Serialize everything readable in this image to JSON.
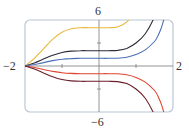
{
  "chart_data": {
    "type": "line",
    "title": "",
    "xlabel": "",
    "ylabel": "",
    "xlim": [
      -2,
      2
    ],
    "ylim": [
      -6,
      6
    ],
    "grid": false,
    "legend": null,
    "tick_labels": {
      "x_min": "−2",
      "x_max": "2",
      "y_max": "6",
      "y_min": "−6"
    },
    "x_ticks": [
      -1,
      0,
      1
    ],
    "y_ticks": [
      -3,
      0,
      3
    ],
    "x": [
      -2,
      -1.75,
      -1.5,
      -1.25,
      -1,
      -0.75,
      -0.5,
      -0.25,
      0,
      0.25,
      0.5,
      0.75,
      1,
      1.25,
      1.5,
      1.6,
      1.7,
      1.8,
      1.9,
      2
    ],
    "series": [
      {
        "name": "C=5",
        "color": "#e8b83a",
        "plateau": 5
      },
      {
        "name": "C=2",
        "color": "#2b2b3a",
        "plateau": 2
      },
      {
        "name": "C=1",
        "color": "#4a6fb5",
        "plateau": 1
      },
      {
        "name": "C=-1",
        "color": "#e0442f",
        "plateau": -1
      },
      {
        "name": "C=-2",
        "color": "#6b1f2a",
        "plateau": -2
      }
    ],
    "shape_factor": [
      0,
      0.2,
      0.45,
      0.7,
      0.88,
      0.97,
      1.0,
      1.0,
      1.0,
      1.0,
      1.02,
      1.15,
      1.5,
      2.1,
      3.2,
      4.0,
      5.2,
      7.0,
      9.5,
      12.0
    ]
  },
  "frame": {
    "border_color": "#b9c6d6",
    "axis_color": "#7a7a7a"
  }
}
